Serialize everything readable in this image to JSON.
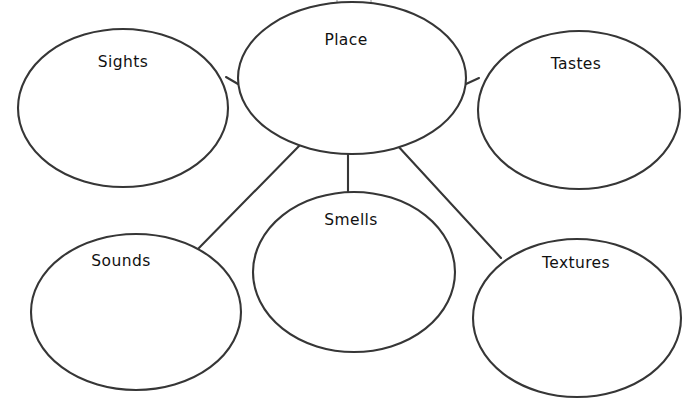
{
  "diagram": {
    "type": "bubble-web-graphic-organizer",
    "stroke_color": "#363636",
    "fill_color": "#ffffff",
    "text_color": "#111111",
    "background_color": "#ffffff",
    "center": {
      "id": "place",
      "label": "Place",
      "cx": 352,
      "cy": 78,
      "rx": 114,
      "ry": 76,
      "label_x": 346,
      "label_y": 40
    },
    "nodes": [
      {
        "id": "sights",
        "label": "Sights",
        "cx": 123,
        "cy": 108,
        "rx": 105,
        "ry": 79,
        "label_x": 123,
        "label_y": 62
      },
      {
        "id": "tastes",
        "label": "Tastes",
        "cx": 579,
        "cy": 110,
        "rx": 101,
        "ry": 79,
        "label_x": 576,
        "label_y": 64
      },
      {
        "id": "sounds",
        "label": "Sounds",
        "cx": 136,
        "cy": 312,
        "rx": 105,
        "ry": 78,
        "label_x": 121,
        "label_y": 261
      },
      {
        "id": "smells",
        "label": "Smells",
        "cx": 354,
        "cy": 272,
        "rx": 101,
        "ry": 80,
        "label_x": 351,
        "label_y": 220
      },
      {
        "id": "textures",
        "label": "Textures",
        "cx": 577,
        "cy": 318,
        "rx": 104,
        "ry": 79,
        "label_x": 576,
        "label_y": 263
      }
    ],
    "connectors": [
      {
        "id": "place-to-sights",
        "from": "place",
        "to": "sights",
        "x1": 238,
        "y1": 84,
        "x2": 226,
        "y2": 77
      },
      {
        "id": "place-to-tastes",
        "from": "place",
        "to": "tastes",
        "x1": 466,
        "y1": 84,
        "x2": 479,
        "y2": 78
      },
      {
        "id": "place-to-sounds",
        "from": "place",
        "to": "sounds",
        "x1": 301,
        "y1": 144,
        "x2": 196,
        "y2": 251
      },
      {
        "id": "place-to-smells",
        "from": "place",
        "to": "smells",
        "x1": 348,
        "y1": 150,
        "x2": 348,
        "y2": 193
      },
      {
        "id": "place-to-textures",
        "from": "place",
        "to": "textures",
        "x1": 397,
        "y1": 145,
        "x2": 501,
        "y2": 258
      }
    ]
  }
}
